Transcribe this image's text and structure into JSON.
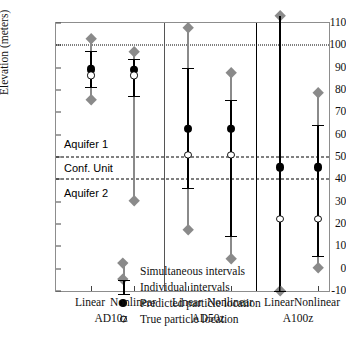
{
  "chart_data": {
    "type": "scatter",
    "title": "",
    "xlabel": "",
    "ylabel": "Elevation (meters)",
    "ylim": [
      -10,
      110
    ],
    "yticks": [
      110,
      100,
      90,
      80,
      70,
      60,
      50,
      40,
      30,
      20,
      10,
      0,
      -10
    ],
    "grid": false,
    "legend_position": "inside-lower-left",
    "categories": [
      "Linear",
      "Nonlinear",
      "Linear",
      "Nonlinear",
      "Linear",
      "Nonlinear"
    ],
    "groups": [
      {
        "name": "AD10z",
        "members": [
          "Linear",
          "Nonlinear"
        ]
      },
      {
        "name": "AD50z",
        "members": [
          "Linear",
          "Nonlinear"
        ]
      },
      {
        "name": "A100z",
        "members": [
          "Linear",
          "Nonlinear"
        ]
      }
    ],
    "reference_lines": [
      {
        "value": 100,
        "style": "dotted",
        "label": ""
      },
      {
        "value": 50,
        "style": "dashed",
        "label": "Aquifer 1"
      },
      {
        "value": 40,
        "style": "dashed",
        "label": "Conf. Unit"
      }
    ],
    "zone_labels": [
      {
        "text": "Aquifer 1",
        "y": 56
      },
      {
        "text": "Conf. Unit",
        "y": 45
      },
      {
        "text": "Aquifer 2",
        "y": 34
      }
    ],
    "series": [
      {
        "name": "Simultaneous intervals",
        "marker": "gray-diamond-bar",
        "color": "#8a8a8a",
        "values": [
          {
            "group": "AD10z",
            "member": "Linear",
            "low": 75.7,
            "high": 103.0
          },
          {
            "group": "AD10z",
            "member": "Nonlinear",
            "low": 30.5,
            "high": 97.2
          },
          {
            "group": "AD50z",
            "member": "Linear",
            "low": 17.3,
            "high": 107.7
          },
          {
            "group": "AD50z",
            "member": "Nonlinear",
            "low": 4.5,
            "high": 87.5
          },
          {
            "group": "A100z",
            "member": "Linear",
            "low": -10.0,
            "high": 113.0
          },
          {
            "group": "A100z",
            "member": "Nonlinear",
            "low": 0.5,
            "high": 78.8
          }
        ]
      },
      {
        "name": "Individual intervals",
        "marker": "black-capped-bar",
        "color": "#000000",
        "values": [
          {
            "group": "AD10z",
            "member": "Linear",
            "low": 81.3,
            "high": 97.6
          },
          {
            "group": "AD10z",
            "member": "Nonlinear",
            "low": 77.2,
            "high": 94.0
          },
          {
            "group": "AD50z",
            "member": "Linear",
            "low": 36.0,
            "high": 89.7
          },
          {
            "group": "AD50z",
            "member": "Nonlinear",
            "low": 14.8,
            "high": 75.5
          },
          {
            "group": "A100z",
            "member": "Linear",
            "low": -10.0,
            "high": 113.0
          },
          {
            "group": "A100z",
            "member": "Nonlinear",
            "low": 5.7,
            "high": 64.5
          }
        ]
      },
      {
        "name": "Predicted particle location",
        "marker": "filled-circle",
        "color": "#000000",
        "values": [
          {
            "group": "AD10z",
            "member": "Linear",
            "y": 89.2
          },
          {
            "group": "AD10z",
            "member": "Nonlinear",
            "y": 89.0
          },
          {
            "group": "AD50z",
            "member": "Linear",
            "y": 62.7
          },
          {
            "group": "AD50z",
            "member": "Nonlinear",
            "y": 62.7
          },
          {
            "group": "A100z",
            "member": "Linear",
            "y": 45.3
          },
          {
            "group": "A100z",
            "member": "Nonlinear",
            "y": 45.3
          }
        ]
      },
      {
        "name": "True particle location",
        "marker": "open-circle",
        "color": "#000000",
        "values": [
          {
            "group": "AD10z",
            "member": "Linear",
            "y": 86.5
          },
          {
            "group": "AD10z",
            "member": "Nonlinear",
            "y": 86.5
          },
          {
            "group": "AD50z",
            "member": "Linear",
            "y": 51.0
          },
          {
            "group": "AD50z",
            "member": "Nonlinear",
            "y": 51.0
          },
          {
            "group": "A100z",
            "member": "Linear",
            "y": 22.3
          },
          {
            "group": "A100z",
            "member": "Nonlinear",
            "y": 22.3
          }
        ]
      }
    ]
  },
  "axis": {
    "y_title": "Elevation (meters)",
    "y_tick_labels": [
      "110",
      "100",
      "90",
      "80",
      "70",
      "60",
      "50",
      "40",
      "30",
      "20",
      "10",
      "0",
      "-10"
    ],
    "x_tick_labels": [
      "Linear",
      "Nonlinear",
      "Linear",
      "Nonlinear",
      "Linear",
      "Nonlinear"
    ],
    "group_labels": [
      "AD10z",
      "AD50z",
      "A100z"
    ]
  },
  "zones": {
    "aquifer1": "Aquifer 1",
    "confining_unit": "Conf. Unit",
    "aquifer2": "Aquifer 2"
  },
  "legend": {
    "items": [
      {
        "label": "Simultaneous intervals",
        "icon": "gray-diamond-bar-icon"
      },
      {
        "label": "Individual intervals",
        "icon": "black-capped-bar-icon"
      },
      {
        "label": "Predicted particle location",
        "icon": "filled-circle-icon"
      },
      {
        "label": "True particle location",
        "icon": "open-circle-icon"
      }
    ]
  },
  "colors": {
    "simultaneous": "#8a8a8a",
    "individual": "#000000",
    "frame": "#8d8d8d",
    "background": "#ffffff"
  }
}
